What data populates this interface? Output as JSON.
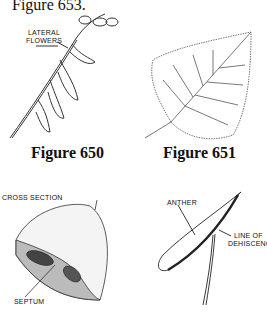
{
  "header": {
    "text": "Figure 653."
  },
  "figures": [
    {
      "caption": "Figure 650",
      "labels": [
        "LATERAL",
        "FLOWERS"
      ]
    },
    {
      "caption": "Figure 651",
      "labels": []
    },
    {
      "caption": "",
      "labels": [
        "CROSS SECTION",
        "SEPTUM"
      ]
    },
    {
      "caption": "",
      "labels": [
        "ANTHER",
        "LINE OF",
        "DEHISCENCE"
      ]
    }
  ]
}
